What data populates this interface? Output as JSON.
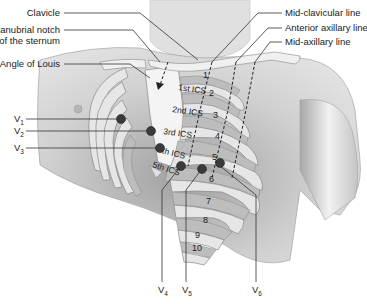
{
  "diagram": {
    "type": "anatomical chest illustration",
    "left_labels": {
      "clavicle": "Clavicle",
      "manubrial_notch_line1": "Manubrial notch",
      "manubrial_notch_line2": "of the sternum",
      "angle_of_louis": "Angle of Louis"
    },
    "right_labels": {
      "mid_clavicular": "Mid-clavicular line",
      "anterior_axillary": "Anterior axillary line",
      "mid_axillary": "Mid-axillary line"
    },
    "intercostal_spaces": [
      "1st ICS",
      "2nd ICS",
      "3rd ICS",
      "4th ICS",
      "5th ICS"
    ],
    "rib_numbers": [
      "1",
      "2",
      "3",
      "4",
      "5",
      "6",
      "7",
      "8",
      "9",
      "10"
    ],
    "electrodes": [
      {
        "id": "V1",
        "base": "V",
        "sub": "1"
      },
      {
        "id": "V2",
        "base": "V",
        "sub": "2"
      },
      {
        "id": "V3",
        "base": "V",
        "sub": "3"
      },
      {
        "id": "V4",
        "base": "V",
        "sub": "4"
      },
      {
        "id": "V5",
        "base": "V",
        "sub": "5"
      },
      {
        "id": "V6",
        "base": "V",
        "sub": "6"
      }
    ],
    "colors": {
      "skin_light": "#e8e8e8",
      "skin_shadow": "#9a9a9a",
      "rib": "#e6e6e6",
      "electrode": "#3a3a3a",
      "line": "#333333"
    }
  }
}
